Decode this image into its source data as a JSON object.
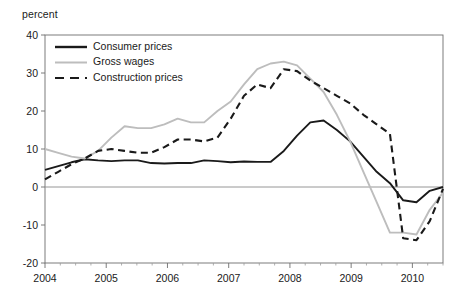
{
  "chart_data": {
    "type": "line",
    "title": "",
    "subtitle": "",
    "xlabel": "",
    "ylabel": "percent",
    "unit_label": "percent",
    "xlim": [
      2004.0,
      2010.5
    ],
    "ylim": [
      -20,
      40
    ],
    "ytick_labels": [
      "40",
      "30",
      "20",
      "10",
      "0",
      "-10",
      "-20"
    ],
    "ytick_values": [
      40,
      30,
      20,
      10,
      0,
      -10,
      -20
    ],
    "xtick_labels": [
      "2004",
      "2005",
      "2006",
      "2007",
      "2008",
      "2009",
      "2010"
    ],
    "xtick_values": [
      2004,
      2005,
      2006,
      2007,
      2008,
      2009,
      2010
    ],
    "minor_xticks_per_year": 4,
    "grid": false,
    "zero_line": true,
    "legend_position": "top-left-inside",
    "x": [
      2004.0,
      2004.25,
      2004.5,
      2004.75,
      2005.0,
      2005.25,
      2005.5,
      2005.75,
      2006.0,
      2006.25,
      2006.5,
      2006.75,
      2007.0,
      2007.25,
      2007.5,
      2007.75,
      2008.0,
      2008.25,
      2008.5,
      2008.75,
      2009.0,
      2009.25,
      2009.5,
      2009.75,
      2010.0,
      2010.25,
      2010.5
    ],
    "series": [
      {
        "name": "Consumer prices",
        "color": "#1a1a1a",
        "style": "solid",
        "values": [
          4.5,
          5.5,
          6.5,
          7.3,
          7.0,
          6.8,
          7.0,
          7.0,
          6.3,
          6.2,
          6.3,
          6.3,
          7.0,
          6.8,
          6.5,
          6.7,
          6.6,
          6.6,
          9.5,
          13.5,
          17.0,
          17.5,
          15.0,
          12.0,
          8.0,
          4.0,
          1.0
        ]
      },
      {
        "name": "Gross wages",
        "color": "#bdbdbd",
        "style": "solid",
        "values": [
          10.0,
          9.0,
          8.0,
          7.5,
          9.5,
          13.0,
          16.0,
          15.5,
          15.5,
          16.5,
          18.0,
          17.0,
          17.0,
          20.0,
          22.5,
          27.0,
          31.0,
          32.5,
          33.0,
          32.0,
          28.5,
          25.0,
          19.0,
          12.0,
          4.0,
          -4.0,
          -12.0
        ]
      },
      {
        "name": "Construction prices",
        "color": "#1a1a1a",
        "style": "dashed",
        "values": [
          2.0,
          4.0,
          6.0,
          7.5,
          9.5,
          10.0,
          9.5,
          9.0,
          9.0,
          10.5,
          12.5,
          12.5,
          12.0,
          13.0,
          18.0,
          24.0,
          27.0,
          26.0,
          31.0,
          30.5,
          28.0,
          26.0,
          24.0,
          22.0,
          19.0,
          16.5,
          14.0
        ]
      }
    ],
    "series_tail": {
      "note": "values continue past 2010 to right edge at 2010.5",
      "consumer_prices": [
        -3.5,
        -4.0,
        -1.0,
        0.0
      ],
      "gross_wages": [
        -12.0,
        -12.5,
        -6.0,
        -1.5
      ],
      "construction_prices": [
        -13.5,
        -14.0,
        -9.0,
        -0.5
      ]
    }
  },
  "legend": {
    "items": [
      {
        "label": "Consumer prices",
        "color": "#1a1a1a",
        "style": "solid"
      },
      {
        "label": "Gross wages",
        "color": "#bdbdbd",
        "style": "solid"
      },
      {
        "label": "Construction prices",
        "color": "#1a1a1a",
        "style": "dashed"
      }
    ]
  }
}
